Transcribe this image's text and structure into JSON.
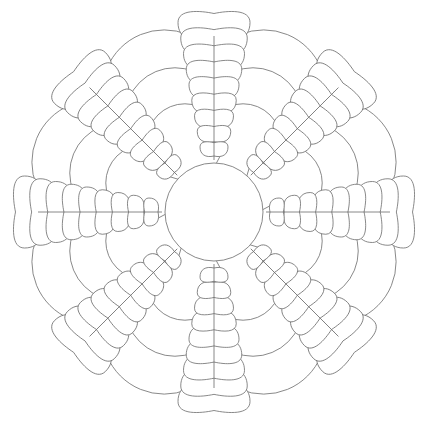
{
  "image": {
    "description": "Line-art mandala coloring page: central circle with eight feathered plumes and layered scalloped arcs",
    "width": 430,
    "height": 423,
    "background": "#ffffff",
    "stroke_color": "#6b6b6b"
  },
  "mandala": {
    "center": [
      214,
      212
    ],
    "center_circle_radius": 49,
    "plume_count": 8,
    "plume_angles_deg": [
      -90,
      -45,
      0,
      45,
      90,
      135,
      180,
      225
    ],
    "plume": {
      "spine_start": 52,
      "spine_end": 190,
      "feathers_per_side": 9
    },
    "scallop_rings": [
      {
        "radius": 192,
        "arc_radius": 62
      },
      {
        "radius": 152,
        "arc_radius": 50
      },
      {
        "radius": 114,
        "arc_radius": 38
      }
    ]
  }
}
